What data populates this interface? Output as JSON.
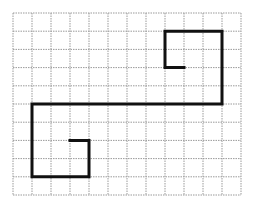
{
  "diagram": {
    "type": "grid-path",
    "grid": {
      "columns": 12,
      "rows": 10,
      "origin_px": [
        13,
        13
      ],
      "cell_w": 19,
      "cell_h": 18.2,
      "line_color": "#9a9a9a",
      "line_style": "dotted"
    },
    "path": {
      "stroke_color": "#111111",
      "stroke_width": 3,
      "points": [
        [
          9,
          3
        ],
        [
          8,
          3
        ],
        [
          8,
          1
        ],
        [
          11,
          1
        ],
        [
          11,
          5
        ],
        [
          1,
          5
        ],
        [
          1,
          9
        ],
        [
          4,
          9
        ],
        [
          4,
          7
        ],
        [
          3,
          7
        ]
      ]
    }
  }
}
